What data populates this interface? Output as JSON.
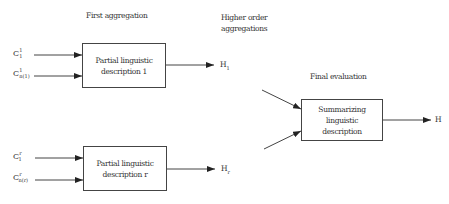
{
  "headings": {
    "first_aggregation": "First aggregation",
    "higher_order_line1": "Higher order",
    "higher_order_line2": "aggregations",
    "final_evaluation": "Final evaluation"
  },
  "boxes": [
    {
      "id": "partial-1",
      "text": "Partial linguistic\ndescription 1"
    },
    {
      "id": "partial-r",
      "text": "Partial linguistic\ndescription r"
    },
    {
      "id": "summarizing",
      "text": "Summarizing\nlinguistic\ndescription"
    }
  ],
  "inputs": {
    "group1": [
      {
        "base": "C",
        "sup": "1",
        "sub": "1"
      },
      {
        "base": "C",
        "sup": "1",
        "sub": "n(1)"
      }
    ],
    "groupr": [
      {
        "base": "C",
        "sup": "r",
        "sub": "1"
      },
      {
        "base": "C",
        "sup": "r",
        "sub": "n(r)"
      }
    ]
  },
  "outputs": {
    "h1": {
      "base": "H",
      "sub": "1"
    },
    "hr": {
      "base": "H",
      "sub": "r"
    },
    "final": {
      "base": "H"
    }
  },
  "colors": {
    "line": "#333333",
    "background": "#ffffff"
  }
}
